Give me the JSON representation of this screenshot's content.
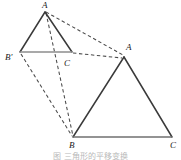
{
  "figure": {
    "type": "geometry-diagram",
    "width": 181,
    "height": 160,
    "background_color": "#ffffff",
    "stroke_color": "#333333",
    "base_stroke_color": "#8c8c8c",
    "dash_color": "#4a4a4a",
    "label_color": "#1a1a1a"
  },
  "small_triangle": {
    "name": "triangle-a-bprime-c",
    "vertices": {
      "A": {
        "label": "A",
        "x": 45,
        "y": 12
      },
      "Bp": {
        "label": "B'",
        "x": 20,
        "y": 52
      },
      "C": {
        "label": "C",
        "x": 72,
        "y": 52
      }
    },
    "label_positions": {
      "A": {
        "x": 42,
        "y": 1
      },
      "Bp": {
        "x": 5,
        "y": 53
      },
      "C": {
        "x": 64,
        "y": 59
      }
    }
  },
  "large_triangle": {
    "name": "triangle-a-b-c",
    "vertices": {
      "A": {
        "label": "A",
        "x": 124,
        "y": 57
      },
      "B": {
        "label": "B",
        "x": 73,
        "y": 137
      },
      "C": {
        "label": "C",
        "x": 172,
        "y": 137
      }
    },
    "label_positions": {
      "A": {
        "x": 126,
        "y": 43
      },
      "B": {
        "x": 69,
        "y": 141
      },
      "C": {
        "x": 170,
        "y": 141
      }
    }
  },
  "dashed_connectors": [
    {
      "name": "connector-smallA-to-largeA",
      "from": "small.A",
      "to": "large.A",
      "x1": 46,
      "y1": 12,
      "x2": 123,
      "y2": 55
    },
    {
      "name": "connector-smallA-to-largeB",
      "from": "small.A",
      "to": "large.B",
      "x1": 46,
      "y1": 13,
      "x2": 73,
      "y2": 136
    },
    {
      "name": "connector-smallC-to-largeA",
      "from": "small.C",
      "to": "large.A",
      "x1": 73,
      "y1": 53,
      "x2": 122,
      "y2": 58
    },
    {
      "name": "connector-smallBprime-to-largeB",
      "from": "small.Bp",
      "to": "large.B",
      "x1": 21,
      "y1": 54,
      "x2": 72,
      "y2": 136
    }
  ],
  "caption": {
    "text": "图  三角形的平移变换"
  }
}
